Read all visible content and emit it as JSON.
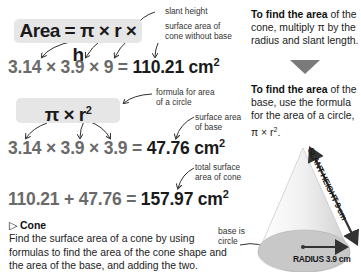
{
  "formula1": {
    "label": "Area = π × r × h",
    "calculation": "3.14 × 3.9 × 9 = ",
    "result": "110.21 cm",
    "result_sup": "2",
    "note_slant": "slant height",
    "note_surface_line1": "surface area of",
    "note_surface_line2": "cone without base"
  },
  "formula2": {
    "label": "π × r",
    "label_sup": "2",
    "calculation": "3.14 × 3.9 × 3.9 = ",
    "result": "47.76 cm",
    "result_sup": "2",
    "note_formula_line1": "formula for area",
    "note_formula_line2": "of a circle",
    "note_base_line1": "surface area",
    "note_base_line2": "of base"
  },
  "formula3": {
    "calculation": "110.21 + 47.76 = ",
    "result": "157.97 cm",
    "result_sup": "2",
    "note_line1": "total surface",
    "note_line2": "area of cone"
  },
  "section": {
    "marker": "▷",
    "title": "Cone",
    "body": "Find the surface area of a cone by using formulas to find the area of the cone shape and the area of the base, and adding the two."
  },
  "sidebar": {
    "step1_bold": "To find the area",
    "step1_text": " of the cone, multiply π by the radius and slant length.",
    "step2_bold": "To find the area",
    "step2_text": " of the base, use the formula for the area of a circle, π × r",
    "step2_sup": "2",
    "step2_end": "."
  },
  "diagram": {
    "slant_label": "SLANT HEIGHT 9 cm",
    "radius_label": "RADIUS 3.9 cm",
    "base_note_line1": "base is",
    "base_note_line2": "circle",
    "colors": {
      "cone_light": "#f2f2f2",
      "cone_dark": "#cfcfcf",
      "base": "#c8c8c8",
      "arrow": "#333333",
      "triangle": "#7a7a7a"
    }
  }
}
